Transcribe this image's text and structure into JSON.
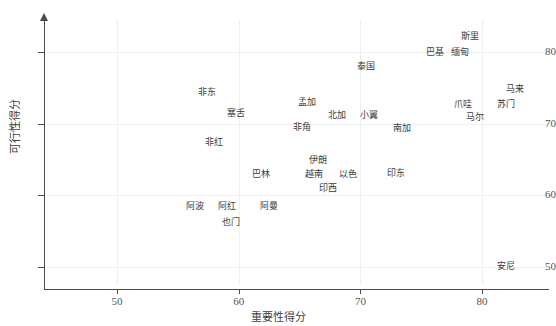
{
  "chart_data": {
    "type": "scatter",
    "title": "",
    "xlabel": "重要性得分",
    "ylabel": "可行性得分",
    "xlim": [
      44.0,
      85.5
    ],
    "ylim": [
      47.5,
      84.5
    ],
    "grid": true,
    "legend": null,
    "xticks": [
      50,
      60,
      70,
      80
    ],
    "yticks": [
      50,
      60,
      70,
      80
    ],
    "label_mode": "text-only (no markers drawn)",
    "points": [
      {
        "label": "斯里",
        "x": 79.0,
        "y": 82.3
      },
      {
        "label": "巴基",
        "x": 76.1,
        "y": 80.0
      },
      {
        "label": "缅甸",
        "x": 78.2,
        "y": 80.0
      },
      {
        "label": "泰国",
        "x": 70.5,
        "y": 78.1
      },
      {
        "label": "马来",
        "x": 82.7,
        "y": 74.8
      },
      {
        "label": "非东",
        "x": 57.4,
        "y": 74.5
      },
      {
        "label": "孟加",
        "x": 65.6,
        "y": 73.0
      },
      {
        "label": "爪哇",
        "x": 78.4,
        "y": 72.8
      },
      {
        "label": "苏门",
        "x": 82.0,
        "y": 72.8
      },
      {
        "label": "塞舌",
        "x": 59.8,
        "y": 71.5
      },
      {
        "label": "北加",
        "x": 68.1,
        "y": 71.2
      },
      {
        "label": "小翼",
        "x": 70.7,
        "y": 71.2
      },
      {
        "label": "马尔",
        "x": 79.4,
        "y": 71.0
      },
      {
        "label": "非角",
        "x": 65.2,
        "y": 69.5
      },
      {
        "label": "南加",
        "x": 73.4,
        "y": 69.4
      },
      {
        "label": "非红",
        "x": 58.0,
        "y": 67.4
      },
      {
        "label": "伊朗",
        "x": 66.5,
        "y": 64.9
      },
      {
        "label": "巴林",
        "x": 61.8,
        "y": 63.0
      },
      {
        "label": "越南",
        "x": 66.2,
        "y": 63.0
      },
      {
        "label": "以色",
        "x": 69.0,
        "y": 63.0
      },
      {
        "label": "印东",
        "x": 72.9,
        "y": 63.2
      },
      {
        "label": "印西",
        "x": 67.3,
        "y": 61.0
      },
      {
        "label": "阿波",
        "x": 56.4,
        "y": 58.5
      },
      {
        "label": "阿红",
        "x": 59.0,
        "y": 58.5
      },
      {
        "label": "阿曼",
        "x": 62.5,
        "y": 58.5
      },
      {
        "label": "也门",
        "x": 59.4,
        "y": 56.3
      },
      {
        "label": "安尼",
        "x": 82.0,
        "y": 50.1
      }
    ]
  }
}
